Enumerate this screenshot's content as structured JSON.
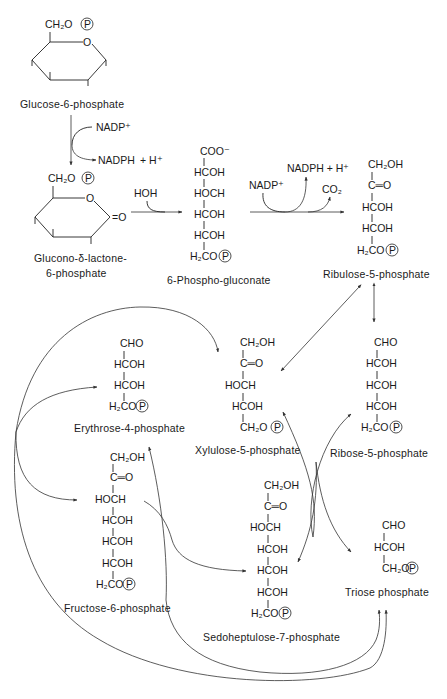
{
  "diagram": {
    "compounds": {
      "glucose6p": {
        "name": "Glucose-6-phosphate",
        "ring_substituent": "CH₂O",
        "ring_oxygen": "O",
        "phosphate": "P"
      },
      "gluconolactone": {
        "name_line1": "Glucono-δ-lactone-",
        "name_line2": "6-phosphate",
        "ring_substituent": "CH₂O",
        "ring_oxygen": "O",
        "carbonyl": "=O",
        "phosphate": "P"
      },
      "phosphogluconate": {
        "name": "6-Phospho-gluconate",
        "rows": [
          "COO⁻",
          "HCOH",
          "HOCH",
          "HCOH",
          "HCOH",
          "H₂CO"
        ],
        "phosphate": "P"
      },
      "ribulose5p": {
        "name": "Ribulose-5-phosphate",
        "rows": [
          "CH₂OH",
          "C═O",
          "HCOH",
          "HCOH",
          "H₂CO"
        ],
        "phosphate": "P"
      },
      "erythrose4p": {
        "name": "Erythrose-4-phosphate",
        "rows": [
          "CHO",
          "HCOH",
          "HCOH",
          "H₂CO"
        ],
        "phosphate": "P"
      },
      "xylulose5p": {
        "name": "Xylulose-5-phosphate",
        "rows": [
          "CH₂OH",
          "C═O",
          "HOCH",
          "HCOH",
          "CH₂O"
        ],
        "phosphate": "P"
      },
      "ribose5p": {
        "name": "Ribose-5-phosphate",
        "rows": [
          "CHO",
          "HCOH",
          "HCOH",
          "HCOH",
          "H₂CO"
        ],
        "phosphate": "P"
      },
      "fructose6p": {
        "name": "Fructose-6-phosphate",
        "rows": [
          "CH₂OH",
          "C═O",
          "HOCH",
          "HCOH",
          "HCOH",
          "HCOH",
          "H₂CO"
        ],
        "phosphate": "P"
      },
      "sedoheptulose7p": {
        "name": "Sedoheptulose-7-phosphate",
        "rows": [
          "CH₂OH",
          "C═O",
          "HOCH",
          "HCOH",
          "HCOH",
          "HCOH",
          "H₂CO"
        ],
        "phosphate": "P"
      },
      "triosep": {
        "name": "Triose phosphate",
        "rows": [
          "CHO",
          "HCOH",
          "CH₂O"
        ],
        "phosphate": "P"
      }
    },
    "cofactors": {
      "nadp_in_1": "NADP⁺",
      "nadph_out_1": "NADPH",
      "h_plus_1": "+ H⁺",
      "hoh": "HOH",
      "nadp_in_2": "NADP⁺",
      "nadph_out_2": "NADPH + H⁺",
      "co2": "CO₂"
    }
  }
}
